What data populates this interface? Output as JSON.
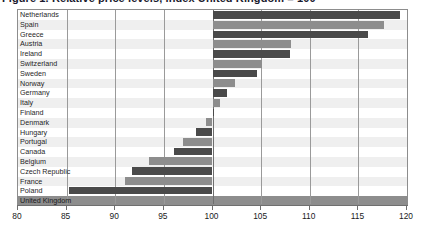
{
  "figure": {
    "title": "Figure 1.  Relative price levels, index United Kingdom = 100",
    "bar_color_dark": "#4a4a4a",
    "bar_color_light": "#8d8d8d",
    "baseline_label": "United Kingdom"
  },
  "chart_data": {
    "type": "bar",
    "orientation": "horizontal",
    "title": "Figure 1.  Relative price levels, index United Kingdom = 100",
    "xlabel": "",
    "ylabel": "",
    "xlim": [
      80,
      120
    ],
    "baseline": 100,
    "grid": true,
    "legend": "none",
    "xticks": [
      80,
      85,
      90,
      95,
      100,
      105,
      110,
      115,
      120
    ],
    "categories": [
      "Netherlands",
      "Spain",
      "Greece",
      "Austria",
      "Ireland",
      "Switzerland",
      "Sweden",
      "Norway",
      "Germany",
      "Italy",
      "Finland",
      "Denmark",
      "Hungary",
      "Portugal",
      "Canada",
      "Belgium",
      "Czech Republic",
      "France",
      "Poland",
      "United Kingdom"
    ],
    "values": [
      119.3,
      117.6,
      116.0,
      108.1,
      108.0,
      105.1,
      104.6,
      102.3,
      101.5,
      100.8,
      100.2,
      99.3,
      98.3,
      97.0,
      96.0,
      93.5,
      91.7,
      91.0,
      85.2,
      100.0
    ],
    "bar_shades": [
      "dark",
      "light",
      "dark",
      "light",
      "dark",
      "light",
      "dark",
      "light",
      "dark",
      "light",
      "dark",
      "light",
      "dark",
      "light",
      "dark",
      "light",
      "dark",
      "light",
      "dark",
      "light"
    ]
  }
}
